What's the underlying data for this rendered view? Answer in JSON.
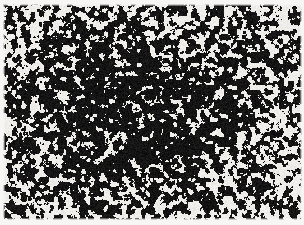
{
  "image": {
    "kind": "binarized-noise-texture",
    "caption": "Granular black-and-white speckle texture with radial density gradient",
    "width": 304,
    "height": 225,
    "background_color": "#f2f0ee",
    "paper_color": "#efedea",
    "ink_color": "#131313",
    "margin_color": "#f7f6f4"
  },
  "texture": {
    "pattern": "thresholded value-noise blobs",
    "blob_scale_px": 4.6,
    "octaves": 3,
    "gradient": "radial",
    "center_x_fraction": 0.46,
    "center_y_fraction": 0.47,
    "center_coverage_percent": 10,
    "edge_coverage_percent": 52,
    "falloff_exponent": 1.65,
    "grain_amount": 0.1,
    "seed": 20250817
  },
  "margins": {
    "top_px": 4,
    "left_px": 3,
    "right_px": 2,
    "bottom_px": 5,
    "feather_px": 2
  }
}
